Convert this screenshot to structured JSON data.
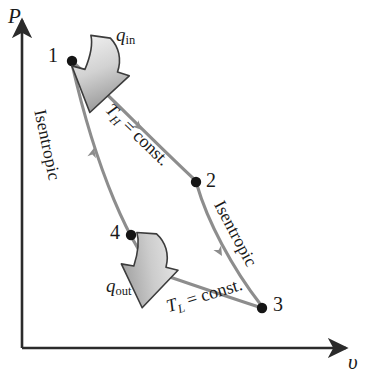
{
  "figure": {
    "kind": "pv-diagram",
    "background_color": "#ffffff",
    "axis_color": "#2b2b2b",
    "curve_color": "#8d8d8d",
    "arrow_fill_light": "#e8e8e8",
    "arrow_fill_dark": "#8f8f8f",
    "arrow_outline": "#3a3a3a",
    "text_color": "#1a1a1a"
  },
  "axes": {
    "y_label": "P",
    "x_label": "υ",
    "origin": {
      "x": 22,
      "y": 348
    },
    "y_top": {
      "x": 22,
      "y": 14
    },
    "x_right": {
      "x": 352,
      "y": 348
    }
  },
  "states": [
    {
      "id": "1",
      "label": "1",
      "dot": {
        "x": 72,
        "y": 61
      },
      "label_pos": {
        "x": 48,
        "y": 45
      }
    },
    {
      "id": "2",
      "label": "2",
      "dot": {
        "x": 196,
        "y": 182
      },
      "label_pos": {
        "x": 205,
        "y": 170
      }
    },
    {
      "id": "3",
      "label": "3",
      "dot": {
        "x": 262,
        "y": 308
      },
      "label_pos": {
        "x": 272,
        "y": 294
      }
    },
    {
      "id": "4",
      "label": "4",
      "dot": {
        "x": 131,
        "y": 235
      },
      "label_pos": {
        "x": 110,
        "y": 222
      }
    }
  ],
  "processes": [
    {
      "id": "1-2",
      "name": "isothermal-expansion-high-temperature",
      "label": "T_H = const.",
      "label_html": "<i>T</i><sub>H</sub> = const.",
      "rotation_deg": 44,
      "label_pos": {
        "x": 115,
        "y": 100
      }
    },
    {
      "id": "2-3",
      "name": "isentropic-expansion",
      "label": "Isentropic",
      "rotation_deg": 62,
      "label_pos": {
        "x": 224,
        "y": 197
      }
    },
    {
      "id": "3-4",
      "name": "isothermal-compression-low-temperature",
      "label": "T_L = const.",
      "label_html": "<i>T</i><sub>L</sub> = const.",
      "rotation_deg": -17,
      "label_pos": {
        "x": 164,
        "y": 296
      }
    },
    {
      "id": "4-1",
      "name": "isentropic-compression",
      "label": "Isentropic",
      "rotation_deg": 78,
      "label_pos": {
        "x": 44,
        "y": 110
      }
    }
  ],
  "heat_arrows": [
    {
      "id": "q-in",
      "label": "q_in",
      "symbol": "q",
      "subscript": "in",
      "label_pos": {
        "x": 116,
        "y": 26
      },
      "direction": "into-cycle",
      "points_toward": "1-2 isothermal curve"
    },
    {
      "id": "q-out",
      "label": "q_out",
      "symbol": "q",
      "subscript": "out",
      "label_pos": {
        "x": 106,
        "y": 276
      },
      "direction": "out-of-cycle",
      "points_away_from": "3-4 isothermal curve"
    }
  ]
}
